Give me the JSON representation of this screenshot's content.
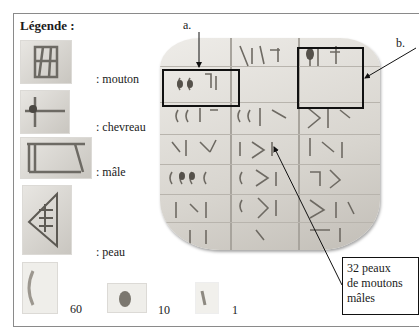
{
  "legend": {
    "title": "Légende :",
    "items": [
      {
        "label": ": mouton",
        "icon": "sheep-sign-icon"
      },
      {
        "label": ": chevreau",
        "icon": "kid-goat-sign-icon"
      },
      {
        "label": ": mâle",
        "icon": "male-sign-icon"
      },
      {
        "label": ": peau",
        "icon": "skin-sign-icon"
      }
    ],
    "numerals": [
      {
        "value": "60",
        "icon": "numeral-60-icon"
      },
      {
        "value": "10",
        "icon": "numeral-10-icon"
      },
      {
        "value": "1",
        "icon": "numeral-1-icon"
      }
    ]
  },
  "tablet": {
    "callouts": {
      "a": "a.",
      "b": "b."
    },
    "note": {
      "line1": "32 peaux",
      "line2": "de moutons",
      "line3": "mâles"
    }
  }
}
